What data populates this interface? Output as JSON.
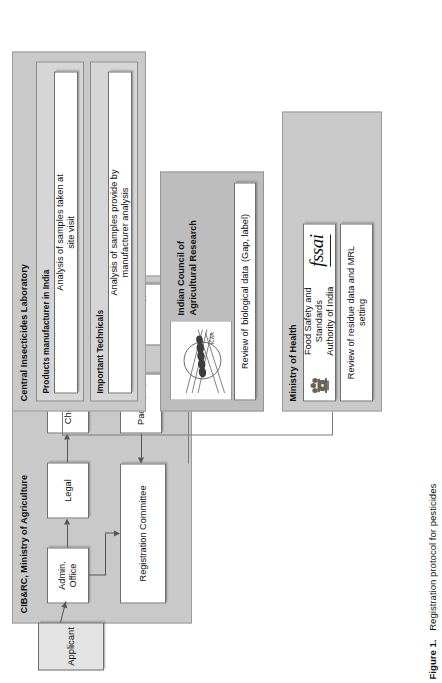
{
  "figure": {
    "caption_number": "Figure 1.",
    "caption_text": "Registration protocol for pesticides"
  },
  "colors": {
    "panel_fill": "#c9c9c9",
    "panel_dark_fill": "#bdbdbd",
    "subpanel_fill": "#d6d6d6",
    "box_fill": "#ffffff",
    "applicant_fill": "#e3e3e3",
    "line": "#555555"
  },
  "applicant": {
    "label": "Applicant"
  },
  "cibrc": {
    "title": "CIB&RC, Ministry of Agriculture",
    "nodes": {
      "admin_office": "Admin.\nOffice",
      "admin_office_line1": "Admin.",
      "admin_office_line2": "Office",
      "legal": "Legal",
      "chemistry": "Chemistry",
      "bioefficacy": "Bioefficacy",
      "toxicology": "Toxicology",
      "packaging": "Packaging",
      "registration_committee": "Registration Committee"
    }
  },
  "ministry_of_health": {
    "title": "Ministry of Health",
    "authority": {
      "name": "Food Safety and Standards\nAuthority of India",
      "name_line1": "Food Safety and Standards",
      "name_line2": "Authority of India",
      "logo_name": "fssai-logo",
      "logo_text": "fssai",
      "emblem_name": "india-state-emblem-icon"
    },
    "task": "Review of residue data and MRL\nsetting",
    "task_line1": "Review of residue data and MRL",
    "task_line2": "setting"
  },
  "icar": {
    "title": "Indian Council of\nAgricultural Research",
    "title_line1": "Indian Council of",
    "title_line2": "Agricultural Research",
    "logo_name": "icar-logo",
    "logo_hindi": "भाकृअनुप",
    "logo_abbr": "I.C.A.R.",
    "task": "Review of\nbiological data\n(Gap, label)",
    "task_line1": "Review of",
    "task_line2": "biological data",
    "task_line3": "(Gap, label)"
  },
  "cil": {
    "title": "Central Insecticides Laboratory",
    "groups": [
      {
        "label": "Products manufacturer in India",
        "task": "Analysis of samples taken at\nsite visit",
        "task_line1": "Analysis of samples taken at",
        "task_line2": "site visit"
      },
      {
        "label": "Important Technicals",
        "task": "Analysis of samples provide by\nmanufacturer analysis",
        "task_line1": "Analysis of samples provide by",
        "task_line2": "manufacturer analysis"
      }
    ]
  }
}
